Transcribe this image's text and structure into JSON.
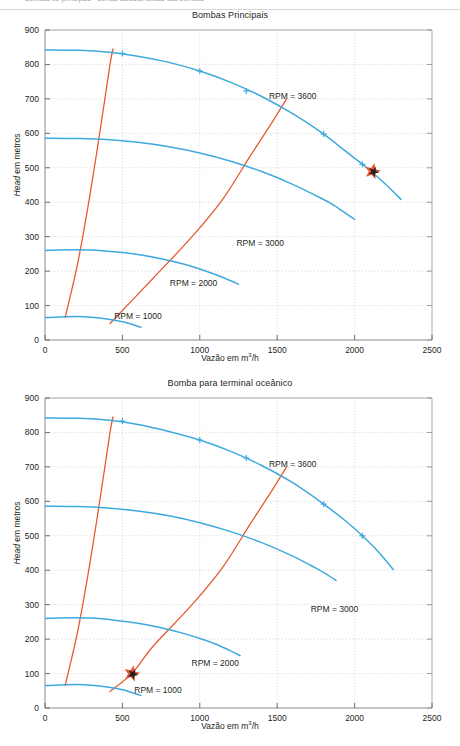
{
  "runninghead": {
    "text": "Bombas de principais - curvas características das bombas"
  },
  "figures": [
    {
      "id": "bombas-principais",
      "title": "Bombas Principais",
      "xlabel_pre": "Vazão em m",
      "xlabel_sup": "3",
      "xlabel_post": "/h",
      "ylabel_em": "Head",
      "ylabel_rest": " em metros",
      "colors": {
        "curve": "#3fa9dd",
        "iso": "#e8552f",
        "marker_fill": "#e8552f",
        "marker_core": "#231f20",
        "axis": "#8a8a8a",
        "grid": "#b9b9b9"
      },
      "chart_data": {
        "type": "line",
        "title": "Bombas Principais",
        "xlabel": "Vazão em m3/h",
        "ylabel": "Head em metros",
        "xlim": [
          0,
          2500
        ],
        "ylim": [
          0,
          900
        ],
        "xticks": [
          0,
          500,
          1000,
          1500,
          2000,
          2500
        ],
        "yticks": [
          0,
          100,
          200,
          300,
          400,
          500,
          600,
          700,
          800,
          900
        ],
        "grid": true,
        "legend": "inline-annotations",
        "series": [
          {
            "name": "RPM = 3600",
            "label": "RPM = 3600",
            "label_at": [
              1600,
              700
            ],
            "color": "#3fa9dd",
            "points": [
              [
                0,
                842
              ],
              [
                200,
                841
              ],
              [
                400,
                836
              ],
              [
                600,
                824
              ],
              [
                800,
                806
              ],
              [
                1000,
                781
              ],
              [
                1200,
                748
              ],
              [
                1400,
                707
              ],
              [
                1600,
                657
              ],
              [
                1800,
                598
              ],
              [
                1900,
                563
              ],
              [
                2000,
                528
              ],
              [
                2100,
                492
              ],
              [
                2200,
                452
              ],
              [
                2300,
                408
              ]
            ],
            "tick_points": [
              [
                500,
                832
              ],
              [
                1000,
                781
              ],
              [
                1300,
                723
              ],
              [
                1800,
                598
              ],
              [
                2050,
                510
              ]
            ]
          },
          {
            "name": "RPM = 3000",
            "label": "RPM = 3000",
            "label_at": [
              1390,
              272
            ],
            "color": "#3fa9dd",
            "points": [
              [
                0,
                586
              ],
              [
                200,
                585
              ],
              [
                400,
                582
              ],
              [
                600,
                574
              ],
              [
                800,
                561
              ],
              [
                1000,
                543
              ],
              [
                1200,
                519
              ],
              [
                1400,
                489
              ],
              [
                1600,
                452
              ],
              [
                1800,
                408
              ],
              [
                1870,
                390
              ],
              [
                1900,
                381
              ],
              [
                2000,
                350
              ]
            ],
            "tick_points": []
          },
          {
            "name": "RPM = 2000",
            "label": "RPM = 2000",
            "label_at": [
              960,
              157
            ],
            "color": "#3fa9dd",
            "points": [
              [
                0,
                260
              ],
              [
                150,
                262
              ],
              [
                300,
                261
              ],
              [
                450,
                256
              ],
              [
                600,
                248
              ],
              [
                750,
                236
              ],
              [
                900,
                220
              ],
              [
                1000,
                206
              ],
              [
                1100,
                190
              ],
              [
                1200,
                172
              ],
              [
                1250,
                162
              ]
            ],
            "tick_points": []
          },
          {
            "name": "RPM = 1000",
            "label": "RPM = 1000",
            "label_at": [
              600,
              62
            ],
            "color": "#3fa9dd",
            "points": [
              [
                0,
                65
              ],
              [
                100,
                67
              ],
              [
                200,
                68
              ],
              [
                300,
                66
              ],
              [
                400,
                61
              ],
              [
                500,
                53
              ],
              [
                560,
                46
              ],
              [
                620,
                37
              ]
            ],
            "tick_points": []
          }
        ],
        "iso_efficiency_lines": [
          {
            "name": "iso-left",
            "color": "#e8552f",
            "points": [
              [
                130,
                65
              ],
              [
                210,
                220
              ],
              [
                290,
                420
              ],
              [
                360,
                620
              ],
              [
                420,
                800
              ],
              [
                440,
                845
              ]
            ]
          },
          {
            "name": "iso-right",
            "color": "#e8552f",
            "points": [
              [
                420,
                48
              ],
              [
                700,
                180
              ],
              [
                950,
                300
              ],
              [
                1150,
                410
              ],
              [
                1320,
                530
              ],
              [
                1450,
                620
              ],
              [
                1560,
                700
              ]
            ]
          }
        ],
        "markers": [
          {
            "name": "operating-point",
            "shape": "star",
            "x": 2115,
            "y": 490
          }
        ]
      }
    },
    {
      "id": "bomba-terminal-oceanico",
      "title": "Bomba para terminal oceânico",
      "xlabel_pre": "Vazão em m",
      "xlabel_sup": "3",
      "xlabel_post": "/h",
      "ylabel_em": "Head",
      "ylabel_rest": " em metros",
      "colors": {
        "curve": "#3fa9dd",
        "iso": "#e8552f",
        "marker_fill": "#e8552f",
        "marker_core": "#231f20",
        "axis": "#8a8a8a",
        "grid": "#b9b9b9"
      },
      "chart_data": {
        "type": "line",
        "title": "Bomba para terminal oceânico",
        "xlabel": "Vazão em m3/h",
        "ylabel": "Head em metros",
        "xlim": [
          0,
          2500
        ],
        "ylim": [
          0,
          900
        ],
        "xticks": [
          0,
          500,
          1000,
          1500,
          2000,
          2500
        ],
        "yticks": [
          0,
          100,
          200,
          300,
          400,
          500,
          600,
          700,
          800,
          900
        ],
        "grid": true,
        "legend": "inline-annotations",
        "series": [
          {
            "name": "RPM = 3600",
            "label": "RPM = 3600",
            "label_at": [
              1600,
              700
            ],
            "color": "#3fa9dd",
            "points": [
              [
                0,
                842
              ],
              [
                200,
                841
              ],
              [
                400,
                836
              ],
              [
                600,
                823
              ],
              [
                800,
                803
              ],
              [
                1000,
                778
              ],
              [
                1200,
                745
              ],
              [
                1400,
                704
              ],
              [
                1600,
                654
              ],
              [
                1800,
                592
              ],
              [
                1950,
                540
              ],
              [
                2050,
                500
              ],
              [
                2150,
                455
              ],
              [
                2250,
                402
              ]
            ],
            "tick_points": [
              [
                500,
                833
              ],
              [
                1000,
                778
              ],
              [
                1300,
                726
              ],
              [
                1800,
                592
              ],
              [
                2050,
                500
              ]
            ]
          },
          {
            "name": "RPM = 3000",
            "label": "RPM = 3000",
            "label_at": [
              1870,
              278
            ],
            "color": "#3fa9dd",
            "points": [
              [
                0,
                586
              ],
              [
                200,
                585
              ],
              [
                400,
                581
              ],
              [
                600,
                572
              ],
              [
                800,
                558
              ],
              [
                1000,
                538
              ],
              [
                1200,
                512
              ],
              [
                1400,
                480
              ],
              [
                1600,
                441
              ],
              [
                1750,
                406
              ],
              [
                1830,
                385
              ],
              [
                1880,
                370
              ]
            ],
            "tick_points": []
          },
          {
            "name": "RPM = 2000",
            "label": "RPM = 2000",
            "label_at": [
              1100,
              123
            ],
            "color": "#3fa9dd",
            "points": [
              [
                0,
                260
              ],
              [
                150,
                262
              ],
              [
                300,
                261
              ],
              [
                450,
                255
              ],
              [
                600,
                246
              ],
              [
                750,
                233
              ],
              [
                900,
                216
              ],
              [
                1000,
                202
              ],
              [
                1100,
                186
              ],
              [
                1200,
                166
              ],
              [
                1260,
                152
              ]
            ],
            "tick_points": []
          },
          {
            "name": "RPM = 1000",
            "label": "RPM = 1000",
            "label_at": [
              730,
              45
            ],
            "color": "#3fa9dd",
            "points": [
              [
                0,
                65
              ],
              [
                100,
                67
              ],
              [
                200,
                68
              ],
              [
                300,
                66
              ],
              [
                400,
                61
              ],
              [
                500,
                53
              ],
              [
                560,
                45
              ],
              [
                620,
                36
              ]
            ],
            "tick_points": []
          }
        ],
        "iso_efficiency_lines": [
          {
            "name": "iso-left",
            "color": "#e8552f",
            "points": [
              [
                130,
                65
              ],
              [
                210,
                220
              ],
              [
                290,
                420
              ],
              [
                360,
                620
              ],
              [
                420,
                800
              ],
              [
                440,
                845
              ]
            ]
          },
          {
            "name": "iso-right",
            "color": "#e8552f",
            "points": [
              [
                420,
                48
              ],
              [
                560,
                100
              ],
              [
                700,
                180
              ],
              [
                950,
                300
              ],
              [
                1150,
                410
              ],
              [
                1320,
                530
              ],
              [
                1450,
                620
              ],
              [
                1560,
                700
              ]
            ]
          }
        ],
        "markers": [
          {
            "name": "operating-point",
            "shape": "star",
            "x": 560,
            "y": 100
          }
        ]
      }
    }
  ]
}
